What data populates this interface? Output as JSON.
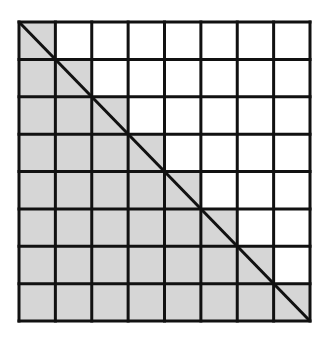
{
  "diagram": {
    "type": "grid-diagonal",
    "rows": 8,
    "cols": 8,
    "shaded_region": "on and below main diagonal",
    "colors": {
      "shade": "#d6d6d6",
      "unshaded": "#ffffff",
      "line": "#111111"
    },
    "diagonal": "top-left to bottom-right"
  }
}
